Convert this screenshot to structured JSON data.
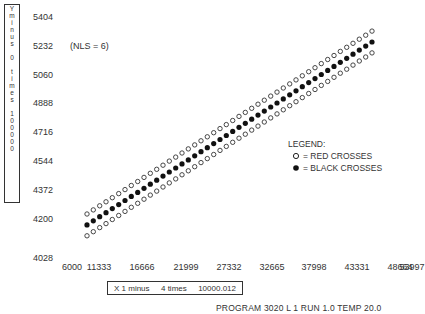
{
  "chart_data": {
    "type": "scatter",
    "title": "",
    "annotation": "(NLS = 6)",
    "ylabel_chars": [
      "Y",
      "m",
      "i",
      "n",
      "u",
      "s",
      "",
      "0",
      "",
      "t",
      "i",
      "m",
      "e",
      "s",
      "",
      "1",
      "0",
      "0",
      "0",
      "0",
      "0"
    ],
    "ylabel": "Y minus 0 times 100000",
    "xlabel": "X 1 minus 4 times 10000.012",
    "xlabel_parts": [
      "X 1 minus",
      "4 times",
      "10000.012"
    ],
    "footer": "PROGRAM 3020 L 1 RUN 1.0 TEMP 20.0",
    "y_ticks": [
      5404,
      5232,
      5060,
      4888,
      4716,
      4544,
      4372,
      4200,
      4028
    ],
    "x_ticks": [
      6000,
      11333,
      16666,
      21999,
      27332,
      32665,
      37998,
      43331,
      48664,
      53997
    ],
    "xlim": [
      6000,
      53997
    ],
    "ylim": [
      4028,
      5404
    ],
    "grid": false,
    "legend_position": "right-middle",
    "legend_title": "LEGEND:",
    "series": [
      {
        "name": "RED CROSSES (upper)",
        "marker": "open-circle",
        "x_start": 8700,
        "x_end": 44000,
        "y_start": 4230,
        "y_end": 5320,
        "n_points": 46
      },
      {
        "name": "BLACK CROSSES",
        "marker": "filled-circle",
        "x_start": 8700,
        "x_end": 44000,
        "y_start": 4165,
        "y_end": 5255,
        "n_points": 46
      },
      {
        "name": "RED CROSSES (lower)",
        "marker": "open-circle",
        "x_start": 8700,
        "x_end": 44000,
        "y_start": 4100,
        "y_end": 5190,
        "n_points": 46
      }
    ]
  },
  "legend": {
    "title": "LEGEND:",
    "items": [
      {
        "symbol": "open-circle",
        "label": "= RED CROSSES"
      },
      {
        "symbol": "filled-circle",
        "label": "= BLACK CROSSES"
      }
    ]
  }
}
